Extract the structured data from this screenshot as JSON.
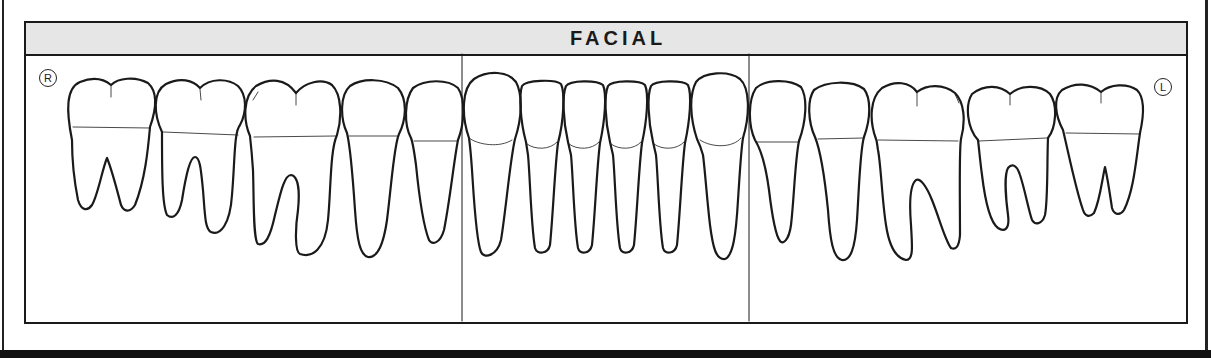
{
  "chart": {
    "title": "FACIAL",
    "right_side_marker": "R",
    "left_side_marker": "L",
    "header_fill": "#e6e6e6",
    "line_color": "#1a1a1a",
    "sections": [
      "right-posterior",
      "anterior",
      "left-posterior"
    ],
    "teeth": [
      {
        "position": 1,
        "type": "third-molar",
        "side": "right",
        "roots": 2
      },
      {
        "position": 2,
        "type": "second-molar",
        "side": "right",
        "roots": 2
      },
      {
        "position": 3,
        "type": "first-molar",
        "side": "right",
        "roots": 2
      },
      {
        "position": 4,
        "type": "second-premolar",
        "side": "right",
        "roots": 1
      },
      {
        "position": 5,
        "type": "first-premolar",
        "side": "right",
        "roots": 1
      },
      {
        "position": 6,
        "type": "canine",
        "side": "right",
        "roots": 1
      },
      {
        "position": 7,
        "type": "lateral-incisor",
        "side": "right",
        "roots": 1
      },
      {
        "position": 8,
        "type": "central-incisor",
        "side": "right",
        "roots": 1
      },
      {
        "position": 9,
        "type": "central-incisor",
        "side": "left",
        "roots": 1
      },
      {
        "position": 10,
        "type": "lateral-incisor",
        "side": "left",
        "roots": 1
      },
      {
        "position": 11,
        "type": "canine",
        "side": "left",
        "roots": 1
      },
      {
        "position": 12,
        "type": "first-premolar",
        "side": "left",
        "roots": 1
      },
      {
        "position": 13,
        "type": "second-premolar",
        "side": "left",
        "roots": 1
      },
      {
        "position": 14,
        "type": "first-molar",
        "side": "left",
        "roots": 2
      },
      {
        "position": 15,
        "type": "second-molar",
        "side": "left",
        "roots": 2
      },
      {
        "position": 16,
        "type": "third-molar",
        "side": "left",
        "roots": 2
      }
    ]
  }
}
